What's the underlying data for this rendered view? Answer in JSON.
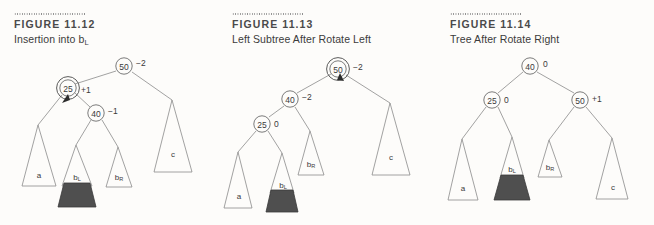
{
  "figures": [
    {
      "id": "figure-11-12",
      "label": "FIGURE 11.12",
      "title_prefix": "Insertion into b",
      "title_sub": "L",
      "title_full": "Insertion into bL",
      "nodes": [
        {
          "name": "node-50",
          "key": "50",
          "balance": "–2",
          "cx": 124,
          "cy": 66,
          "highlight": false
        },
        {
          "name": "node-25",
          "key": "25",
          "balance": "+1",
          "cx": 68,
          "cy": 88,
          "highlight": true
        },
        {
          "name": "node-40",
          "key": "40",
          "balance": "–1",
          "cx": 96,
          "cy": 113,
          "highlight": false
        }
      ],
      "subtrees": [
        {
          "name": "subtree-a",
          "label": "a",
          "sub": "",
          "shaded": false
        },
        {
          "name": "subtree-bl",
          "label": "b",
          "sub": "L",
          "shaded": true
        },
        {
          "name": "subtree-br",
          "label": "b",
          "sub": "R",
          "shaded": false
        },
        {
          "name": "subtree-c",
          "label": "c",
          "sub": "",
          "shaded": false
        }
      ],
      "arrow": "insertion-arrow"
    },
    {
      "id": "figure-11-13",
      "label": "FIGURE 11.13",
      "title_prefix": "Left Subtree After Rotate Left",
      "title_sub": "",
      "title_full": "Left Subtree After Rotate Left",
      "nodes": [
        {
          "name": "node-50",
          "key": "50",
          "balance": "–2",
          "cx": 338,
          "cy": 69,
          "highlight": true
        },
        {
          "name": "node-40",
          "key": "40",
          "balance": "–2",
          "cx": 290,
          "cy": 99,
          "highlight": false
        },
        {
          "name": "node-25",
          "key": "25",
          "balance": "0",
          "cx": 262,
          "cy": 124,
          "highlight": false
        }
      ],
      "subtrees": [
        {
          "name": "subtree-a",
          "label": "a",
          "sub": "",
          "shaded": false
        },
        {
          "name": "subtree-bl",
          "label": "b",
          "sub": "L",
          "shaded": true
        },
        {
          "name": "subtree-br",
          "label": "b",
          "sub": "R",
          "shaded": false
        },
        {
          "name": "subtree-c",
          "label": "c",
          "sub": "",
          "shaded": false
        }
      ],
      "arrow": "rotation-arrow"
    },
    {
      "id": "figure-11-14",
      "label": "FIGURE 11.14",
      "title_prefix": "Tree After Rotate Right",
      "title_sub": "",
      "title_full": "Tree After Rotate Right",
      "nodes": [
        {
          "name": "node-40",
          "key": "40",
          "balance": "0",
          "cx": 530,
          "cy": 66,
          "highlight": false
        },
        {
          "name": "node-25",
          "key": "25",
          "balance": "0",
          "cx": 492,
          "cy": 100,
          "highlight": false
        },
        {
          "name": "node-50",
          "key": "50",
          "balance": "+1",
          "cx": 580,
          "cy": 100,
          "highlight": false
        }
      ],
      "subtrees": [
        {
          "name": "subtree-a",
          "label": "a",
          "sub": "",
          "shaded": false
        },
        {
          "name": "subtree-bl",
          "label": "b",
          "sub": "L",
          "shaded": true
        },
        {
          "name": "subtree-br",
          "label": "b",
          "sub": "R",
          "shaded": false
        },
        {
          "name": "subtree-c",
          "label": "c",
          "sub": "",
          "shaded": false
        }
      ],
      "arrow": ""
    }
  ],
  "colors": {
    "background": "#fdfcfa",
    "line": "#8a8a8a",
    "node_stroke": "#6c6c6c",
    "shade_fill": "#4f4f4f",
    "label_text": "#4a4a4a",
    "title_text": "#3b3b3b"
  }
}
